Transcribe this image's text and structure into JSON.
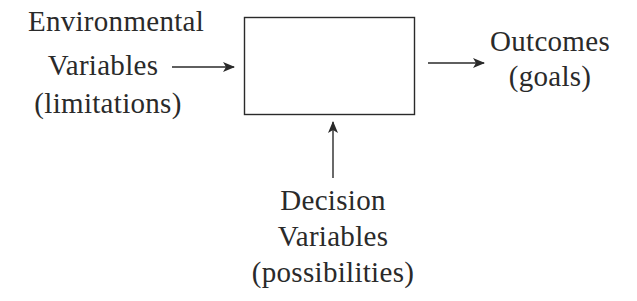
{
  "diagram": {
    "type": "block-diagram",
    "box": {
      "label": ""
    },
    "inputs": {
      "environmental": {
        "line1": "Environmental",
        "line2": "Variables",
        "line3": "(limitations)"
      },
      "decision": {
        "line1": "Decision",
        "line2": "Variables",
        "line3": "(possibilities)"
      }
    },
    "output": {
      "line1": "Outcomes",
      "line2": "(goals)"
    },
    "colors": {
      "ink": "#2a2a2a",
      "background": "#ffffff"
    }
  }
}
